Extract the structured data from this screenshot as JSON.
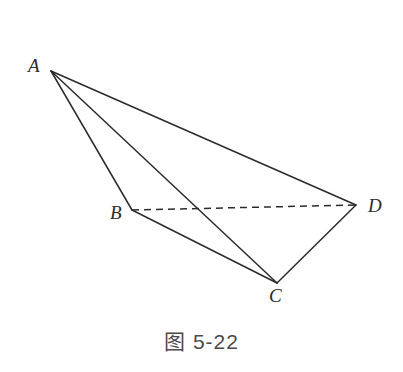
{
  "figure": {
    "caption": "图 5-22",
    "background_color": "#ffffff",
    "stroke_color": "#2b2b2b",
    "label_color": "#2b2b2b",
    "caption_color": "#4a4a4a",
    "width": 403,
    "height": 372
  },
  "vertices": {
    "A": {
      "label": "A",
      "x": 51,
      "y": 71
    },
    "B": {
      "label": "B",
      "x": 132,
      "y": 210
    },
    "C": {
      "label": "C",
      "x": 277,
      "y": 283
    },
    "D": {
      "label": "D",
      "x": 356,
      "y": 205
    }
  },
  "edges": [
    {
      "name": "AB",
      "from": "A",
      "to": "B",
      "style": "solid",
      "x1": 51,
      "y1": 71,
      "x2": 132,
      "y2": 210
    },
    {
      "name": "AC",
      "from": "A",
      "to": "C",
      "style": "solid",
      "x1": 51,
      "y1": 71,
      "x2": 277,
      "y2": 283
    },
    {
      "name": "AD",
      "from": "A",
      "to": "D",
      "style": "solid",
      "x1": 51,
      "y1": 71,
      "x2": 356,
      "y2": 205
    },
    {
      "name": "BC",
      "from": "B",
      "to": "C",
      "style": "solid",
      "x1": 132,
      "y1": 210,
      "x2": 277,
      "y2": 283
    },
    {
      "name": "CD",
      "from": "C",
      "to": "D",
      "style": "solid",
      "x1": 277,
      "y1": 283,
      "x2": 356,
      "y2": 205
    },
    {
      "name": "BD",
      "from": "B",
      "to": "D",
      "style": "dashed",
      "x1": 132,
      "y1": 210,
      "x2": 356,
      "y2": 205
    }
  ]
}
